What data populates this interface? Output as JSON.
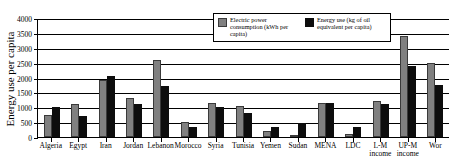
{
  "chart_data": {
    "type": "bar",
    "title": "",
    "xlabel": "",
    "ylabel": "Energy use per capita",
    "ylim": [
      0,
      4000
    ],
    "ytick_labels": [
      "4000",
      "3500",
      "3000",
      "2500",
      "2000",
      "1500",
      "1000",
      "500",
      "0"
    ],
    "ytick_values": [
      4000,
      3500,
      3000,
      2500,
      2000,
      1500,
      1000,
      500,
      0
    ],
    "grid": "horizontal",
    "legend_position": "top-right-inside",
    "categories": [
      "Algeria",
      "Egypt",
      "Iran",
      "Jordan",
      "Lebanon",
      "Morocco",
      "Syria",
      "Tunisia",
      "Yemen",
      "Sudan",
      "MENA",
      "LDC",
      "L-M income",
      "UP-M income",
      "Wor"
    ],
    "series": [
      {
        "name": "Electric power consumption (kWh per capita)",
        "color": "#808080",
        "values": [
          750,
          1100,
          1900,
          1300,
          2600,
          500,
          1150,
          1050,
          200,
          80,
          1150,
          100,
          1200,
          3400,
          2500
        ]
      },
      {
        "name": "Energy use (kg of oil equivalent per capita)",
        "color": "#0d0d0d",
        "values": [
          1000,
          720,
          2050,
          1100,
          1700,
          350,
          1000,
          820,
          320,
          480,
          1150,
          320,
          1100,
          2400,
          1750
        ]
      }
    ]
  },
  "legend": {
    "entries": [
      {
        "label": "Electric power consumption (kWh per capita)"
      },
      {
        "label": "Energy use (kg of oil equivalent per capita)"
      }
    ]
  }
}
